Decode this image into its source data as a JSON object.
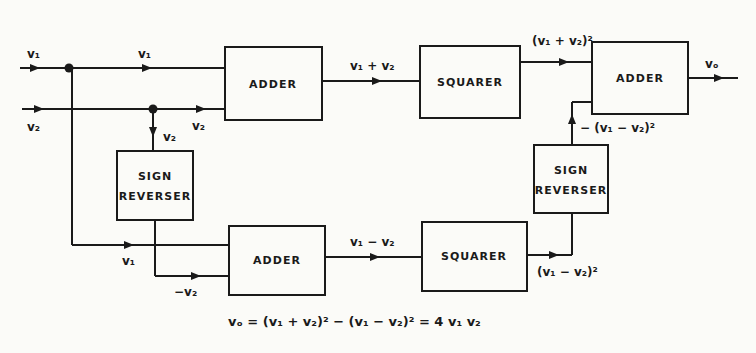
{
  "blocks": {
    "adder_top": "ADDER",
    "squarer_top": "SQUARER",
    "adder_out": "ADDER",
    "sign_left_l1": "SIGN",
    "sign_left_l2": "REVERSER",
    "sign_right_l1": "SIGN",
    "sign_right_l2": "REVERSER",
    "adder_bottom": "ADDER",
    "squarer_bottom": "SQUARER"
  },
  "signals": {
    "in_v1": "v₁",
    "in_v2": "v₂",
    "v1_to_adder": "v₁",
    "v2_to_adder": "v₂",
    "v2_down": "v₂",
    "v1_bottom": "v₁",
    "neg_v2": "−v₂",
    "sum": "v₁ + v₂",
    "diff": "v₁ − v₂",
    "sum_sq": "(v₁ + v₂)²",
    "diff_sq": "(v₁ − v₂)²",
    "neg_diff_sq": "− (v₁ − v₂)²",
    "out": "vₒ"
  },
  "equation": "vₒ =  (v₁ + v₂)²  −  (v₁ − v₂)² = 4 v₁ v₂",
  "colors": {
    "ink": "#1a1a1a",
    "paper": "#fbfbf8"
  }
}
